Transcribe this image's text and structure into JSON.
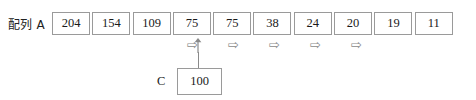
{
  "diagram": {
    "type": "array-pointer-diagram",
    "array": {
      "label": "配列 A",
      "cells": [
        {
          "index": 0,
          "value": "204"
        },
        {
          "index": 1,
          "value": "154"
        },
        {
          "index": 2,
          "value": "109"
        },
        {
          "index": 3,
          "value": "75"
        },
        {
          "index": 4,
          "value": "75"
        },
        {
          "index": 5,
          "value": "38"
        },
        {
          "index": 6,
          "value": "24"
        },
        {
          "index": 7,
          "value": "20"
        },
        {
          "index": 8,
          "value": "19"
        },
        {
          "index": 9,
          "value": "11"
        }
      ]
    },
    "markers": {
      "up_arrow": {
        "glyph": "↑",
        "points_to_cell_index": 3,
        "left": 194
      },
      "right_arrows": [
        {
          "glyph": "⇨",
          "under_cell_index": 5,
          "left": 187
        },
        {
          "glyph": "⇨",
          "under_cell_index": 6,
          "left": 228
        },
        {
          "glyph": "⇨",
          "under_cell_index": 7,
          "left": 269
        },
        {
          "glyph": "⇨",
          "under_cell_index": 8,
          "left": 310
        },
        {
          "glyph": "⇨",
          "under_cell_index": 9,
          "left": 351
        }
      ]
    },
    "variable": {
      "label": "C",
      "value": "100"
    },
    "colors": {
      "border": "#9a9a9a",
      "text": "#1a1a1a",
      "arrow": "#8a8a8a",
      "background": "#ffffff"
    }
  }
}
